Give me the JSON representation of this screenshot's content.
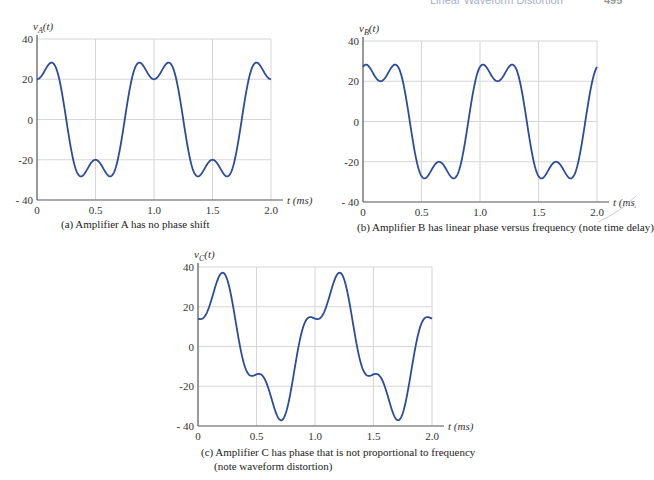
{
  "header": {
    "running_title": "Linear Waveform Distortion",
    "page_number": "495"
  },
  "style": {
    "line_color": "#2b4c9b"
  },
  "chart_data": [
    {
      "id": "a",
      "type": "line",
      "ylabel": "v_A(t)",
      "ylabel_main": "v",
      "ylabel_sub": "A",
      "ylabel_tail": "(t)",
      "xlabel": "t (ms)",
      "caption": "(a) Amplifier A has no phase shift",
      "xlim": [
        0,
        2.0
      ],
      "ylim": [
        -40,
        40
      ],
      "xticks": [
        "0",
        "0.5",
        "1.0",
        "1.5",
        "2.0"
      ],
      "xtick_values": [
        0,
        0.5,
        1.0,
        1.5,
        2.0
      ],
      "yticks": [
        "40",
        "20",
        "0",
        "-20",
        "- 40"
      ],
      "ytick_values": [
        40,
        20,
        0,
        -20,
        -40
      ],
      "grid": true,
      "formula": "30*cos(2*pi*t) - 10*cos(6*pi*t)",
      "harmonics": [
        {
          "n": 1,
          "amp": 30,
          "phase_deg": 0
        },
        {
          "n": 3,
          "amp": 10,
          "phase_deg": 180
        }
      ],
      "key_points": {
        "t": [
          0,
          0.12,
          0.25,
          0.35,
          0.5,
          0.65,
          0.75,
          0.88,
          1.0,
          1.12,
          1.5,
          2.0
        ],
        "v": [
          20,
          28,
          0,
          -29,
          -20,
          -29,
          0,
          28,
          20,
          28,
          -20,
          20
        ]
      }
    },
    {
      "id": "b",
      "type": "line",
      "ylabel": "v_B(t)",
      "ylabel_main": "v",
      "ylabel_sub": "B",
      "ylabel_tail": "(t)",
      "xlabel": "t (ms)",
      "caption": "(b) Amplifier B has linear phase versus frequency (note time delay)",
      "xlim": [
        0,
        2.0
      ],
      "ylim": [
        -40,
        40
      ],
      "xticks": [
        "0",
        "0.5",
        "1.0",
        "1.5",
        "2.0"
      ],
      "xtick_values": [
        0,
        0.5,
        1.0,
        1.5,
        2.0
      ],
      "yticks": [
        "40",
        "20",
        "0",
        "-20",
        "- 40"
      ],
      "ytick_values": [
        40,
        20,
        0,
        -20,
        -40
      ],
      "grid": true,
      "time_delay_ms": 0.15,
      "harmonics": [
        {
          "n": 1,
          "amp": 30,
          "phase_deg": -54
        },
        {
          "n": 3,
          "amp": 10,
          "phase_deg": 18
        }
      ],
      "key_points": {
        "t": [
          0,
          0.15,
          0.27,
          0.4,
          0.5,
          0.65,
          0.8,
          0.9,
          1.0,
          1.15,
          1.5,
          2.0
        ],
        "v": [
          28,
          20,
          28,
          0,
          -29,
          -20,
          -29,
          0,
          28,
          20,
          -29,
          28
        ]
      }
    },
    {
      "id": "c",
      "type": "line",
      "ylabel": "v_C(t)",
      "ylabel_main": "v",
      "ylabel_sub": "C",
      "ylabel_tail": "(t)",
      "xlabel": "t (ms)",
      "caption": "(c) Amplifier C has phase that is not proportional to frequency",
      "caption2": "(note waveform distortion)",
      "xlim": [
        0,
        2.0
      ],
      "ylim": [
        -40,
        40
      ],
      "xticks": [
        "0",
        "0.5",
        "1.0",
        "1.5",
        "2.0"
      ],
      "xtick_values": [
        0,
        0.5,
        1.0,
        1.5,
        2.0
      ],
      "yticks": [
        "40",
        "20",
        "0",
        "-20",
        "- 40"
      ],
      "ytick_values": [
        40,
        20,
        0,
        -20,
        -40
      ],
      "grid": true,
      "harmonics": [
        {
          "n": 1,
          "amp": 30,
          "phase_deg": -54
        },
        {
          "n": 3,
          "amp": 10,
          "phase_deg": 111
        }
      ],
      "key_points": {
        "t": [
          0,
          0.18,
          0.33,
          0.45,
          0.52,
          0.68,
          0.82,
          0.93,
          1.0,
          1.18,
          1.68,
          2.0
        ],
        "v": [
          14,
          37,
          0,
          -16,
          -15,
          -38,
          0,
          15,
          14,
          37,
          -38,
          14
        ]
      }
    }
  ]
}
